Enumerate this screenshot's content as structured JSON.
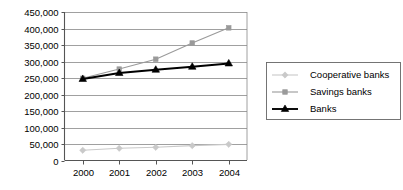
{
  "chart_data": {
    "type": "line",
    "title": "",
    "subtitle": "",
    "xlabel": "",
    "ylabel": "",
    "categories": [
      "2000",
      "2001",
      "2002",
      "2003",
      "2004"
    ],
    "x": [
      2000,
      2001,
      2002,
      2003,
      2004
    ],
    "ylim": [
      0,
      450000
    ],
    "ytick_values": [
      0,
      50000,
      100000,
      150000,
      200000,
      250000,
      300000,
      350000,
      400000,
      450000
    ],
    "ytick_labels": [
      "0",
      "50,000",
      "100,000",
      "150,000",
      "200,000",
      "250,000",
      "300,000",
      "350,000",
      "400,000",
      "450,000"
    ],
    "xtick_labels": [
      "2000",
      "2001",
      "2002",
      "2003",
      "2004"
    ],
    "grid": true,
    "grid_axis": "y",
    "legend_position": "right-outside",
    "series": [
      {
        "name": "Cooperative banks",
        "values": [
          31000,
          37000,
          40000,
          45000,
          49000
        ],
        "color": "#c9c9c9",
        "marker": "diamond"
      },
      {
        "name": "Savings banks",
        "values": [
          249000,
          277000,
          307000,
          356000,
          402000
        ],
        "color": "#9a9a9a",
        "marker": "square"
      },
      {
        "name": "Banks",
        "values": [
          247000,
          265000,
          275000,
          284000,
          294000
        ],
        "color": "#000000",
        "marker": "triangle"
      }
    ]
  },
  "legend": {
    "entries": [
      {
        "label": "Cooperative banks"
      },
      {
        "label": "Savings banks"
      },
      {
        "label": "Banks"
      }
    ]
  }
}
